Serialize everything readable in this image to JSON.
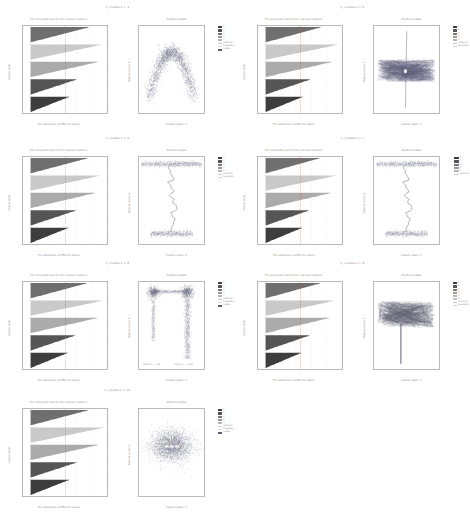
{
  "figure": {
    "background": "#ffffff",
    "grid_rows": 4,
    "grid_cols": 2,
    "cell_count": 7
  },
  "palette": {
    "band_light": "#e4e4e4",
    "band_mid_light": "#c9c9c9",
    "band_mid": "#ababab",
    "band_mid_dark": "#8f8f8f",
    "band_dark": "#6f6f6f",
    "band_darker": "#555555",
    "band_darkest": "#3d3d3d",
    "scatter": "#6e6e86",
    "trace": "#5c5c74",
    "axis": "#b9b9b9",
    "text": "#8d8d8d"
  },
  "cells": [
    {
      "title": "n_clusters = 4",
      "ridge": {
        "title": "The silhouette plot for the various clusters.",
        "xlabel": "The silhouette coefficient values",
        "ylabel": "Cluster label",
        "xticks": [
          "-0.1",
          "0.0",
          "0.2",
          "0.4",
          "0.6",
          "0.8",
          "1.0"
        ],
        "yticks": [
          "0",
          "1",
          "2",
          "3"
        ],
        "avg_line": 0.46,
        "bands": [
          {
            "label": "0",
            "color": "#6f6f6f",
            "width": 0.78,
            "thickness": 0.175
          },
          {
            "label": "1",
            "color": "#c9c9c9",
            "width": 0.95,
            "thickness": 0.155
          },
          {
            "label": "2",
            "color": "#ababab",
            "width": 0.9,
            "thickness": 0.17
          },
          {
            "label": "3",
            "color": "#555555",
            "width": 0.62,
            "thickness": 0.215
          },
          {
            "label": "4",
            "color": "#3d3d3d",
            "width": 0.52,
            "thickness": 0.215
          }
        ]
      },
      "plot": {
        "type": "scatter",
        "title": "Clustered data",
        "xlabel": "Feature space 1",
        "ylabel": "Feature space 2",
        "xticks": [
          "-1.0",
          "-0.5",
          "0.0",
          "0.5",
          "1.0"
        ],
        "yticks": [
          "-1.0",
          "-0.5",
          "0.0",
          "0.5",
          "1.0"
        ],
        "shape": "u-curve",
        "legend": [
          {
            "label": "0",
            "color": "#3d3d3d",
            "kind": "swatch"
          },
          {
            "label": "1",
            "color": "#555555",
            "kind": "swatch"
          },
          {
            "label": "2",
            "color": "#777777",
            "kind": "swatch"
          },
          {
            "label": "3",
            "color": "#9a9a9a",
            "kind": "swatch"
          },
          {
            "label": "4",
            "color": "#b5b5b5",
            "kind": "swatch"
          },
          {
            "label": "centroid",
            "color": "#c9c9c9",
            "kind": "line"
          },
          {
            "label": "boundary",
            "color": "#d4d4d4",
            "kind": "line"
          },
          {
            "label": "outlier",
            "color": "#5c5c74",
            "kind": "swatch"
          }
        ]
      }
    },
    {
      "title": "n_clusters = 5",
      "ridge": {
        "title": "The silhouette plot for the various clusters.",
        "xlabel": "The silhouette coefficient values",
        "ylabel": "Cluster label",
        "xticks": [
          "-0.1",
          "0.0",
          "0.2",
          "0.4",
          "0.6",
          "0.8",
          "1.0"
        ],
        "yticks": [
          "0",
          "1",
          "2",
          "3"
        ],
        "avg_line": 0.46,
        "bands": [
          {
            "label": "0",
            "color": "#6f6f6f",
            "width": 0.74,
            "thickness": 0.175
          },
          {
            "label": "1",
            "color": "#c9c9c9",
            "width": 0.97,
            "thickness": 0.15
          },
          {
            "label": "2",
            "color": "#ababab",
            "width": 0.88,
            "thickness": 0.175
          },
          {
            "label": "3",
            "color": "#555555",
            "width": 0.6,
            "thickness": 0.215
          },
          {
            "label": "4",
            "color": "#3d3d3d",
            "width": 0.5,
            "thickness": 0.215
          }
        ]
      },
      "plot": {
        "type": "trajectory",
        "title": "Clustered data",
        "xlabel": "Feature space 1",
        "ylabel": "Feature space 2",
        "xticks": [
          "-1.0",
          "-0.5",
          "0.0",
          "0.5",
          "1.0"
        ],
        "yticks": [
          "-1.0",
          "-0.5",
          "0.0",
          "0.5",
          "1.0"
        ],
        "shape": "cross-tangle",
        "legend": [
          {
            "label": "0",
            "color": "#3d3d3d",
            "kind": "swatch"
          },
          {
            "label": "1",
            "color": "#555555",
            "kind": "swatch"
          },
          {
            "label": "2",
            "color": "#777777",
            "kind": "swatch"
          },
          {
            "label": "3",
            "color": "#9a9a9a",
            "kind": "swatch"
          },
          {
            "label": "4",
            "color": "#b5b5b5",
            "kind": "swatch"
          },
          {
            "label": "centroid",
            "color": "#c9c9c9",
            "kind": "line"
          },
          {
            "label": "boundary",
            "color": "#d4d4d4",
            "kind": "line"
          }
        ]
      }
    },
    {
      "title": "n_clusters = 6",
      "ridge": {
        "title": "The silhouette plot for the various clusters.",
        "xlabel": "The silhouette coefficient values",
        "ylabel": "Cluster label",
        "xticks": [
          "-0.1",
          "0.0",
          "0.2",
          "0.4",
          "0.6",
          "0.8",
          "1.0"
        ],
        "yticks": [
          "0",
          "1",
          "2",
          "3"
        ],
        "avg_line": 0.46,
        "bands": [
          {
            "label": "0",
            "color": "#6f6f6f",
            "width": 0.76,
            "thickness": 0.175
          },
          {
            "label": "1",
            "color": "#c9c9c9",
            "width": 0.93,
            "thickness": 0.155
          },
          {
            "label": "2",
            "color": "#ababab",
            "width": 0.86,
            "thickness": 0.175
          },
          {
            "label": "3",
            "color": "#555555",
            "width": 0.61,
            "thickness": 0.215
          },
          {
            "label": "4",
            "color": "#3d3d3d",
            "width": 0.51,
            "thickness": 0.215
          }
        ]
      },
      "plot": {
        "type": "trajectory",
        "title": "Clustered data",
        "xlabel": "Feature space 1",
        "ylabel": "Feature space 2",
        "xticks": [
          "-1.0",
          "-0.5",
          "0.0",
          "0.5",
          "1.0"
        ],
        "yticks": [
          "-1.0",
          "-0.5",
          "0.0",
          "0.5",
          "1.0"
        ],
        "shape": "vertical-wiggle",
        "legend": [
          {
            "label": "0",
            "color": "#3d3d3d",
            "kind": "swatch"
          },
          {
            "label": "1",
            "color": "#555555",
            "kind": "swatch"
          },
          {
            "label": "2",
            "color": "#777777",
            "kind": "swatch"
          },
          {
            "label": "3",
            "color": "#9a9a9a",
            "kind": "swatch"
          },
          {
            "label": "4",
            "color": "#b5b5b5",
            "kind": "swatch"
          },
          {
            "label": "centroid",
            "color": "#c9c9c9",
            "kind": "line"
          },
          {
            "label": "boundary",
            "color": "#d4d4d4",
            "kind": "line"
          }
        ]
      }
    },
    {
      "title": "n_clusters = 7",
      "ridge": {
        "title": "The silhouette plot for the various clusters.",
        "xlabel": "The silhouette coefficient values",
        "ylabel": "Cluster label",
        "xticks": [
          "-0.1",
          "0.0",
          "0.2",
          "0.4",
          "0.6",
          "0.8",
          "1.0"
        ],
        "yticks": [
          "0",
          "1",
          "2",
          "3"
        ],
        "avg_line": 0.46,
        "bands": [
          {
            "label": "0",
            "color": "#6f6f6f",
            "width": 0.72,
            "thickness": 0.175
          },
          {
            "label": "1",
            "color": "#c9c9c9",
            "width": 0.94,
            "thickness": 0.15
          },
          {
            "label": "2",
            "color": "#ababab",
            "width": 0.87,
            "thickness": 0.175
          },
          {
            "label": "3",
            "color": "#555555",
            "width": 0.58,
            "thickness": 0.215
          },
          {
            "label": "4",
            "color": "#3d3d3d",
            "width": 0.49,
            "thickness": 0.215
          }
        ]
      },
      "plot": {
        "type": "trajectory",
        "title": "Clustered data",
        "xlabel": "Feature space 1",
        "ylabel": "Feature space 2",
        "xticks": [
          "-1.0",
          "-0.5",
          "0.0",
          "0.5",
          "1.0"
        ],
        "yticks": [
          "-1.0",
          "-0.5",
          "0.0",
          "0.5",
          "1.0"
        ],
        "shape": "vertical-wiggle",
        "legend": [
          {
            "label": "0",
            "color": "#3d3d3d",
            "kind": "swatch"
          },
          {
            "label": "1",
            "color": "#555555",
            "kind": "swatch"
          },
          {
            "label": "2",
            "color": "#777777",
            "kind": "swatch"
          },
          {
            "label": "3",
            "color": "#9a9a9a",
            "kind": "swatch"
          },
          {
            "label": "4",
            "color": "#b5b5b5",
            "kind": "swatch"
          },
          {
            "label": "centroid",
            "color": "#c9c9c9",
            "kind": "line"
          }
        ]
      }
    },
    {
      "title": "n_clusters = 8",
      "ridge": {
        "title": "The silhouette plot for the various clusters.",
        "xlabel": "The silhouette coefficient values",
        "ylabel": "Cluster label",
        "xticks": [
          "-0.1",
          "0.0",
          "0.2",
          "0.4",
          "0.6",
          "0.8",
          "1.0"
        ],
        "yticks": [
          "0",
          "1",
          "2",
          "3"
        ],
        "avg_line": 0.46,
        "bands": [
          {
            "label": "0",
            "color": "#6f6f6f",
            "width": 0.75,
            "thickness": 0.175
          },
          {
            "label": "1",
            "color": "#c9c9c9",
            "width": 0.96,
            "thickness": 0.15
          },
          {
            "label": "2",
            "color": "#ababab",
            "width": 0.89,
            "thickness": 0.175
          },
          {
            "label": "3",
            "color": "#555555",
            "width": 0.6,
            "thickness": 0.215
          },
          {
            "label": "4",
            "color": "#3d3d3d",
            "width": 0.5,
            "thickness": 0.215
          }
        ]
      },
      "plot": {
        "type": "trajectory",
        "title": "Clustered data",
        "xlabel": "Feature space 1",
        "ylabel": "Feature space 2",
        "xticks": [
          "-1.0",
          "-0.5",
          "0.0",
          "0.5",
          "1.0"
        ],
        "yticks": [
          "-1.0",
          "-0.5",
          "0.0",
          "0.5",
          "1.0"
        ],
        "shape": "staple",
        "annotations": [
          "cluster 0 — left",
          "cluster 1 — right"
        ],
        "legend": [
          {
            "label": "0",
            "color": "#3d3d3d",
            "kind": "swatch"
          },
          {
            "label": "1",
            "color": "#555555",
            "kind": "swatch"
          },
          {
            "label": "2",
            "color": "#777777",
            "kind": "swatch"
          },
          {
            "label": "3",
            "color": "#9a9a9a",
            "kind": "swatch"
          },
          {
            "label": "4",
            "color": "#b5b5b5",
            "kind": "swatch"
          },
          {
            "label": "centroid",
            "color": "#c9c9c9",
            "kind": "line"
          },
          {
            "label": "boundary",
            "color": "#d4d4d4",
            "kind": "line"
          },
          {
            "label": "outlier",
            "color": "#5c5c74",
            "kind": "swatch"
          }
        ]
      }
    },
    {
      "title": "n_clusters = 9",
      "ridge": {
        "title": "The silhouette plot for the various clusters.",
        "xlabel": "The silhouette coefficient values",
        "ylabel": "Cluster label",
        "xticks": [
          "-0.1",
          "0.0",
          "0.2",
          "0.4",
          "0.6",
          "0.8",
          "1.0"
        ],
        "yticks": [
          "0",
          "1",
          "2",
          "3"
        ],
        "avg_line": 0.46,
        "bands": [
          {
            "label": "0",
            "color": "#6f6f6f",
            "width": 0.73,
            "thickness": 0.175
          },
          {
            "label": "1",
            "color": "#c9c9c9",
            "width": 0.92,
            "thickness": 0.155
          },
          {
            "label": "2",
            "color": "#ababab",
            "width": 0.85,
            "thickness": 0.175
          },
          {
            "label": "3",
            "color": "#555555",
            "width": 0.59,
            "thickness": 0.215
          },
          {
            "label": "4",
            "color": "#3d3d3d",
            "width": 0.48,
            "thickness": 0.215
          }
        ]
      },
      "plot": {
        "type": "trajectory",
        "title": "Clustered data",
        "xlabel": "Feature space 1",
        "ylabel": "Feature space 2",
        "xticks": [
          "-1.0",
          "-0.5",
          "0.0",
          "0.5",
          "1.0"
        ],
        "yticks": [
          "-1.0",
          "-0.5",
          "0.0",
          "0.5",
          "1.0"
        ],
        "shape": "inverted-t",
        "legend": [
          {
            "label": "0",
            "color": "#3d3d3d",
            "kind": "swatch"
          },
          {
            "label": "1",
            "color": "#555555",
            "kind": "swatch"
          },
          {
            "label": "2",
            "color": "#777777",
            "kind": "swatch"
          },
          {
            "label": "3",
            "color": "#9a9a9a",
            "kind": "swatch"
          },
          {
            "label": "4",
            "color": "#b5b5b5",
            "kind": "swatch"
          },
          {
            "label": "5",
            "color": "#c4c4c4",
            "kind": "swatch"
          },
          {
            "label": "centroid",
            "color": "#c9c9c9",
            "kind": "line"
          },
          {
            "label": "boundary",
            "color": "#d4d4d4",
            "kind": "line"
          }
        ]
      }
    },
    {
      "title": "n_clusters = 10",
      "ridge": {
        "title": "The silhouette plot for the various clusters.",
        "xlabel": "The silhouette coefficient values",
        "ylabel": "Cluster label",
        "xticks": [
          "-0.1",
          "0.0",
          "0.2",
          "0.4",
          "0.6",
          "0.8",
          "1.0"
        ],
        "yticks": [
          "0",
          "1",
          "2",
          "3"
        ],
        "avg_line": 0.46,
        "bands": [
          {
            "label": "0",
            "color": "#6f6f6f",
            "width": 0.77,
            "thickness": 0.175
          },
          {
            "label": "1",
            "color": "#c9c9c9",
            "width": 0.98,
            "thickness": 0.15
          },
          {
            "label": "2",
            "color": "#ababab",
            "width": 0.9,
            "thickness": 0.175
          },
          {
            "label": "3",
            "color": "#555555",
            "width": 0.62,
            "thickness": 0.215
          },
          {
            "label": "4",
            "color": "#3d3d3d",
            "width": 0.52,
            "thickness": 0.215
          }
        ]
      },
      "plot": {
        "type": "scatter",
        "title": "Clustered data",
        "xlabel": "Feature space 1",
        "ylabel": "Feature space 2",
        "xticks": [
          "-1.0",
          "-0.5",
          "0.0",
          "0.5",
          "1.0"
        ],
        "yticks": [
          "-1.0",
          "-0.5",
          "0.0",
          "0.5",
          "1.0"
        ],
        "shape": "blob",
        "legend": [
          {
            "label": "0",
            "color": "#3d3d3d",
            "kind": "swatch"
          },
          {
            "label": "1",
            "color": "#555555",
            "kind": "swatch"
          },
          {
            "label": "2",
            "color": "#777777",
            "kind": "swatch"
          },
          {
            "label": "3",
            "color": "#9a9a9a",
            "kind": "swatch"
          },
          {
            "label": "4",
            "color": "#b5b5b5",
            "kind": "swatch"
          },
          {
            "label": "centroid",
            "color": "#c9c9c9",
            "kind": "line"
          },
          {
            "label": "boundary",
            "color": "#d4d4d4",
            "kind": "line"
          },
          {
            "label": "outlier",
            "color": "#5c5c74",
            "kind": "swatch"
          }
        ]
      }
    }
  ],
  "chart_data": {
    "type": "scatter",
    "panel_pairs": 7,
    "cluster_counts": [
      4,
      5,
      6,
      7,
      8,
      9,
      10
    ],
    "silhouette_average": 0.46,
    "silhouette_xlim": [
      -0.1,
      1.0
    ],
    "feature_xlim": [
      -1.2,
      1.2
    ],
    "feature_ylim": [
      -1.2,
      1.2
    ],
    "grid": true,
    "legend_position": "right",
    "silhouette_widths": {
      "n4": [
        0.78,
        0.95,
        0.9,
        0.62,
        0.52
      ],
      "n5": [
        0.74,
        0.97,
        0.88,
        0.6,
        0.5
      ],
      "n6": [
        0.76,
        0.93,
        0.86,
        0.61,
        0.51
      ],
      "n7": [
        0.72,
        0.94,
        0.87,
        0.58,
        0.49
      ],
      "n8": [
        0.75,
        0.96,
        0.89,
        0.6,
        0.5
      ],
      "n9": [
        0.73,
        0.92,
        0.85,
        0.59,
        0.48
      ],
      "n10": [
        0.77,
        0.98,
        0.9,
        0.62,
        0.52
      ]
    },
    "scatter_shapes": [
      "u-curve",
      "cross-tangle",
      "vertical-wiggle",
      "vertical-wiggle",
      "staple",
      "inverted-t",
      "blob"
    ]
  }
}
